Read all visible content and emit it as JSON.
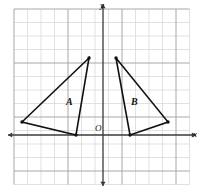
{
  "figure": {
    "kind": "coordinate-grid-geometry-figure",
    "background_color": "#ffffff",
    "grid": {
      "minor_color": "#d9d9d9",
      "major_color": "#a8a8a8",
      "cell_size_px": 13.5,
      "left_px": 14,
      "top_px": 9,
      "columns": 13,
      "rows": 13,
      "major_every": 4,
      "show_grid": true
    },
    "axes": {
      "color": "#3a3a3a",
      "origin_px": {
        "x": 103,
        "y": 135
      },
      "x_axis_y_px": 135,
      "y_axis_x_px": 103,
      "x_label": "x",
      "y_label": "y",
      "origin_label": "O",
      "x_range_units": [
        -6.6,
        6.4
      ],
      "y_range_units": [
        -3.6,
        9.3
      ],
      "tick_labels_shown": false,
      "arrowheads": [
        "left",
        "right",
        "up",
        "down"
      ]
    },
    "shapes": [
      {
        "name": "triangle-a",
        "label": "A",
        "label_px": {
          "x": 66,
          "y": 97
        },
        "stroke_color": "#111111",
        "fill": "none",
        "stroke_width_px": 1.6,
        "vertices_px": [
          {
            "x": 89,
            "y": 58
          },
          {
            "x": 22,
            "y": 122
          },
          {
            "x": 76,
            "y": 135
          }
        ],
        "vertices_units": [
          {
            "x": -1,
            "y": 5.7
          },
          {
            "x": -6,
            "y": 1
          },
          {
            "x": -2,
            "y": 0
          }
        ],
        "vertex_markers": true
      },
      {
        "name": "triangle-b",
        "label": "B",
        "label_px": {
          "x": 131,
          "y": 97
        },
        "stroke_color": "#111111",
        "fill": "none",
        "stroke_width_px": 1.6,
        "vertices_px": [
          {
            "x": 116,
            "y": 58
          },
          {
            "x": 130,
            "y": 135
          },
          {
            "x": 168,
            "y": 122
          }
        ],
        "vertices_units": [
          {
            "x": 1,
            "y": 5.7
          },
          {
            "x": 2,
            "y": 0
          },
          {
            "x": 4.8,
            "y": 1
          }
        ],
        "vertex_markers": true
      }
    ]
  }
}
